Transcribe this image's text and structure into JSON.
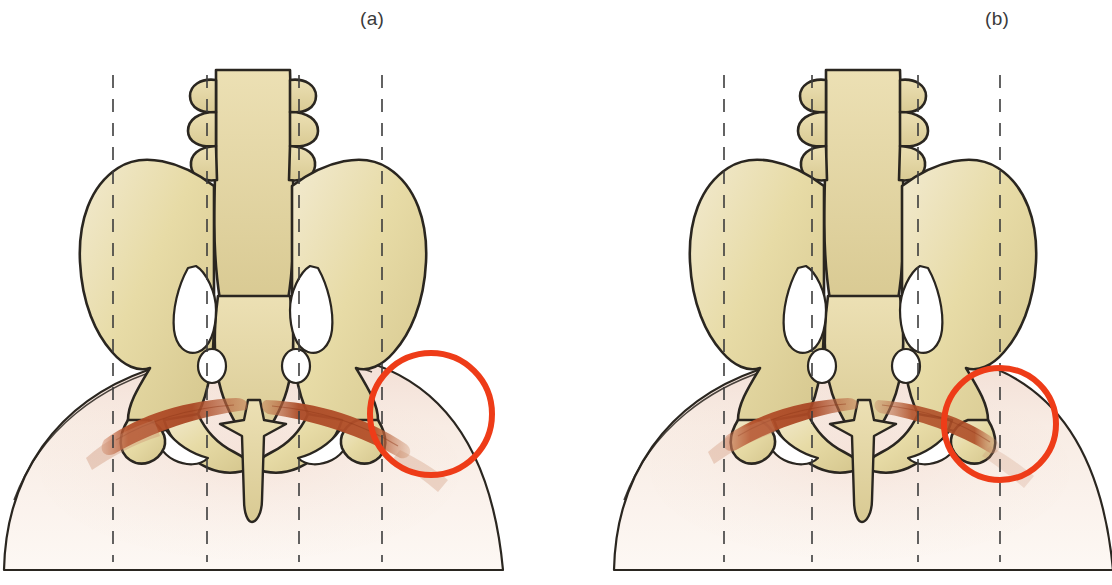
{
  "figure": {
    "kind": "anatomical-illustration",
    "background_color": "#ffffff",
    "panels": [
      {
        "id": "a",
        "label": "(a)",
        "label_x": 380,
        "label_y": 18,
        "center_x": 278,
        "annotation": {
          "type": "circle-highlight",
          "color": "#ee3c18",
          "stroke_width": 6,
          "cx": 431,
          "cy": 414,
          "r": 61
        },
        "guide_lines": {
          "color": "#3c3c3c",
          "style": "dashed",
          "dash": "13 11",
          "width": 1.6,
          "y_top": 75,
          "y_bottom": 562,
          "x_positions": [
            113,
            207,
            299,
            382
          ]
        },
        "muscle": {
          "color": "#b4502a",
          "note": "erector spinae / gluteal bands, fuller on right side"
        },
        "bone": {
          "fill": "#e7dba6",
          "shade": "#cdbe86",
          "outline": "#2a2620"
        },
        "skin": {
          "fill": "#f8efe7",
          "outline": "#2a2620"
        }
      },
      {
        "id": "b",
        "label": "(b)",
        "label_x": 1005,
        "label_y": 18,
        "center_x": 888,
        "annotation": {
          "type": "circle-highlight",
          "color": "#ee3c18",
          "stroke_width": 6,
          "cx": 1000,
          "cy": 424,
          "r": 56
        },
        "guide_lines": {
          "color": "#3c3c3c",
          "style": "dashed",
          "dash": "13 11",
          "width": 1.6,
          "y_top": 75,
          "y_bottom": 562,
          "x_positions": [
            724,
            812,
            918,
            1000
          ]
        },
        "muscle": {
          "color": "#b4502a",
          "note": "erector spinae / gluteal bands, thinner and shorter on right side"
        },
        "bone": {
          "fill": "#e7dba6",
          "shade": "#cdbe86",
          "outline": "#2a2620"
        },
        "skin": {
          "fill": "#f8efe7",
          "outline": "#2a2620"
        }
      }
    ],
    "colors": {
      "bone_fill": "#e7dba6",
      "bone_light": "#f0e8c2",
      "bone_shade": "#cbbb80",
      "bone_outline": "#2a2620",
      "muscle_red": "#b4502a",
      "muscle_dark": "#9a3f1f",
      "muscle_pale": "#dba98e",
      "skin_fill": "#f8efe7",
      "skin_tint": "#f6e4dd",
      "highlight_red": "#ee3c18",
      "guide_gray": "#3c3c3c",
      "label_gray": "#3a3a3a",
      "background": "#ffffff"
    }
  }
}
